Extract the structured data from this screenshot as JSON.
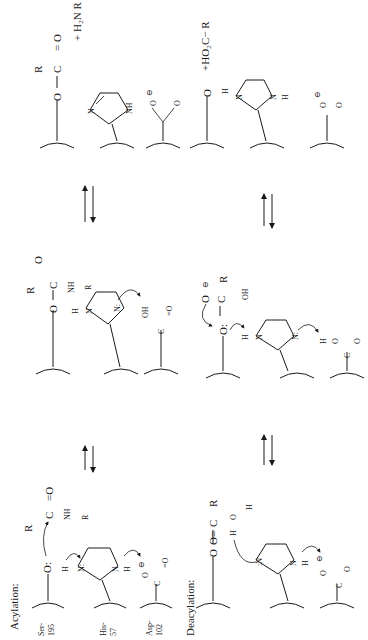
{
  "diagram": {
    "orientation": "rotated-90-ccw",
    "sections": [
      {
        "id": "acylation",
        "label": "Acylation:",
        "residues": [
          {
            "name": "Ser-",
            "number": "195"
          },
          {
            "name": "His-",
            "number": "57"
          },
          {
            "name": "Asp-",
            "number": "102"
          }
        ],
        "states": [
          {
            "id": "acyl-1",
            "ser_group": "O:",
            "ser_h": "H",
            "substrate": {
              "r1": "R",
              "carbon": "C",
              "carbonyl": "=O",
              "amide": "NH",
              "r2": "R"
            },
            "his_n1": "N:",
            "his_n2": "N",
            "his_h": "H",
            "asp_o": "O",
            "asp_charge": "⊖",
            "asp_c": "C",
            "asp_o2": "=O"
          },
          {
            "id": "acyl-2",
            "ser_group": "O",
            "substrate": {
              "r1": "R",
              "carbon": "C",
              "oxy": "O",
              "amide": "NH",
              "r2": "R"
            },
            "his_h": "H",
            "his_n1": "N",
            "his_n2": "N:",
            "asp_group": "OH",
            "asp_c": "C",
            "asp_o2": "=O"
          },
          {
            "id": "acyl-3",
            "ser_group": "O",
            "product": {
              "r1": "R",
              "carbon": "C",
              "carbonyl": "= O",
              "leaving": "+ H₂N R"
            },
            "his_n1": "N",
            "his_n2": "NH",
            "asp_charge": "⊖",
            "asp_o": "O",
            "asp_c": "C",
            "asp_o2": "O"
          }
        ]
      },
      {
        "id": "deacylation",
        "label": "Deacylation:",
        "states": [
          {
            "id": "deacyl-1",
            "ser_group": "O",
            "acyl": {
              "carbon": "C",
              "carbonyl": "O=",
              "r": "R"
            },
            "water": {
              "h1": "H",
              "o": "O",
              "h2": "H"
            },
            "his_n1": ":N",
            "his_n2": "N",
            "his_h": "H",
            "asp_charge": "⊖",
            "asp_o": "O",
            "asp_c": "C",
            "asp_o2": "O"
          },
          {
            "id": "deacyl-2",
            "ser_group": "O:",
            "tetra": {
              "o_minus": "O",
              "charge": "⊖",
              "carbon": "C",
              "r": "R",
              "oh": "OH"
            },
            "his_h": "H",
            "his_n1": "N",
            "his_n2": "N:",
            "asp_h": "H",
            "asp_o": "O",
            "asp_c": "C",
            "asp_o2": "O"
          },
          {
            "id": "deacyl-3",
            "ser_group": "O",
            "ser_h": "H",
            "product": "+HO₂C− R",
            "his_n1": "N",
            "his_n2": "N",
            "his_h": "H",
            "asp_charge": "⊖",
            "asp_o": "O",
            "asp_c": "C",
            "asp_o2": "O"
          }
        ]
      }
    ],
    "arrows": [
      {
        "type": "equilibrium",
        "between": [
          "acyl-1",
          "acyl-2"
        ]
      },
      {
        "type": "equilibrium",
        "between": [
          "acyl-2",
          "acyl-3"
        ]
      },
      {
        "type": "equilibrium",
        "between": [
          "deacyl-1",
          "deacyl-2"
        ]
      },
      {
        "type": "equilibrium",
        "between": [
          "deacyl-2",
          "deacyl-3"
        ]
      }
    ]
  }
}
